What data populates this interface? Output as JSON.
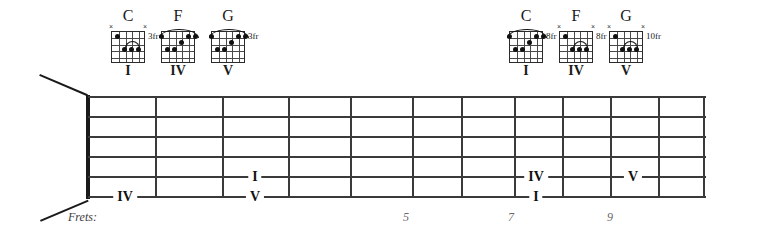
{
  "diagram": {
    "kind": "guitar-fretboard-chart",
    "frets_label": "Frets:",
    "fret_numbers": [
      {
        "label": "5",
        "x": 406
      },
      {
        "label": "7",
        "x": 511
      },
      {
        "label": "9",
        "x": 610
      }
    ]
  },
  "chord_groups": [
    {
      "id": "group-left",
      "chords": [
        {
          "name": "C",
          "degree": "I",
          "position_label": "3fr",
          "strings_muted": [
            1,
            6
          ],
          "barre": null,
          "partial_barre": {
            "from_string": 4,
            "to_string": 2,
            "fret": 3
          },
          "dots": [
            {
              "string": 5,
              "fret": 1
            },
            {
              "string": 4,
              "fret": 3
            },
            {
              "string": 3,
              "fret": 3
            },
            {
              "string": 2,
              "fret": 3
            }
          ]
        },
        {
          "name": "F",
          "degree": "IV",
          "position_label": "",
          "strings_muted": [],
          "barre": {
            "fret": 1,
            "from_string": 6,
            "to_string": 1
          },
          "partial_barre": null,
          "dots": [
            {
              "string": 6,
              "fret": 1
            },
            {
              "string": 5,
              "fret": 3
            },
            {
              "string": 4,
              "fret": 3
            },
            {
              "string": 3,
              "fret": 2
            },
            {
              "string": 2,
              "fret": 1
            },
            {
              "string": 1,
              "fret": 1
            }
          ]
        },
        {
          "name": "G",
          "degree": "V",
          "position_label": "3fr",
          "strings_muted": [],
          "barre": {
            "fret": 1,
            "from_string": 6,
            "to_string": 1
          },
          "partial_barre": null,
          "dots": [
            {
              "string": 6,
              "fret": 1
            },
            {
              "string": 5,
              "fret": 3
            },
            {
              "string": 4,
              "fret": 3
            },
            {
              "string": 3,
              "fret": 2
            },
            {
              "string": 2,
              "fret": 1
            },
            {
              "string": 1,
              "fret": 1
            }
          ]
        }
      ]
    },
    {
      "id": "group-right",
      "chords": [
        {
          "name": "C",
          "degree": "I",
          "position_label": "8fr",
          "strings_muted": [],
          "barre": {
            "fret": 1,
            "from_string": 6,
            "to_string": 1
          },
          "partial_barre": null,
          "dots": [
            {
              "string": 6,
              "fret": 1
            },
            {
              "string": 5,
              "fret": 3
            },
            {
              "string": 4,
              "fret": 3
            },
            {
              "string": 3,
              "fret": 2
            },
            {
              "string": 2,
              "fret": 1
            },
            {
              "string": 1,
              "fret": 1
            }
          ]
        },
        {
          "name": "F",
          "degree": "IV",
          "position_label": "8fr",
          "strings_muted": [
            1,
            6
          ],
          "barre": null,
          "partial_barre": {
            "from_string": 4,
            "to_string": 2,
            "fret": 3
          },
          "dots": [
            {
              "string": 5,
              "fret": 1
            },
            {
              "string": 4,
              "fret": 3
            },
            {
              "string": 3,
              "fret": 3
            },
            {
              "string": 2,
              "fret": 3
            }
          ]
        },
        {
          "name": "G",
          "degree": "V",
          "position_label": "10fr",
          "strings_muted": [
            1,
            6
          ],
          "barre": null,
          "partial_barre": {
            "from_string": 4,
            "to_string": 2,
            "fret": 3
          },
          "dots": [
            {
              "string": 5,
              "fret": 1
            },
            {
              "string": 4,
              "fret": 3
            },
            {
              "string": 3,
              "fret": 3
            },
            {
              "string": 2,
              "fret": 3
            }
          ]
        }
      ]
    }
  ],
  "fretboard": {
    "strings": 6,
    "markers": [
      {
        "label": "IV",
        "string": 6,
        "x": 125,
        "y": 197
      },
      {
        "label": "I",
        "string": 5,
        "x": 255,
        "y": 177
      },
      {
        "label": "V",
        "string": 6,
        "x": 255,
        "y": 197
      },
      {
        "label": "IV",
        "string": 5,
        "x": 536,
        "y": 177
      },
      {
        "label": "I",
        "string": 6,
        "x": 536,
        "y": 197
      },
      {
        "label": "V",
        "string": 5,
        "x": 633,
        "y": 177
      }
    ]
  }
}
